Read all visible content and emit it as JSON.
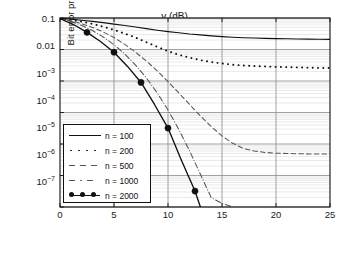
{
  "chart_data": {
    "type": "line",
    "title": "",
    "xlabel": "γ (dB)",
    "ylabel": "Bit error probability",
    "xlim": [
      0,
      25
    ],
    "ylim": [
      1e-07,
      0.1
    ],
    "yscale": "log",
    "grid": true,
    "legend_position": "lower-left",
    "xticks": [
      "0",
      "5",
      "10",
      "15",
      "20",
      "25"
    ],
    "xtick_values": [
      0,
      5,
      10,
      15,
      20,
      25
    ],
    "yticks": [
      "0.1",
      "0.01",
      "10−3",
      "10−4",
      "10−5",
      "10−6",
      "10−7"
    ],
    "ytick_values": [
      0.1,
      0.01,
      0.001,
      0.0001,
      1e-05,
      1e-06,
      1e-07
    ],
    "series": [
      {
        "name": "n = 100",
        "style": "solid",
        "color": "#111111",
        "x": [
          0,
          1,
          2,
          3,
          4,
          5,
          6,
          7,
          8,
          9,
          10,
          11,
          12,
          13,
          14,
          15,
          16,
          17,
          18,
          19,
          20,
          21,
          22,
          23,
          24,
          25
        ],
        "y": [
          0.098,
          0.092,
          0.085,
          0.078,
          0.071,
          0.064,
          0.058,
          0.052,
          0.046,
          0.041,
          0.037,
          0.034,
          0.031,
          0.029,
          0.027,
          0.0255,
          0.0245,
          0.0237,
          0.0231,
          0.0226,
          0.0222,
          0.0219,
          0.0216,
          0.0213,
          0.0211,
          0.0209
        ]
      },
      {
        "name": "n = 200",
        "style": "dotted",
        "color": "#111111",
        "x": [
          0,
          1,
          2,
          3,
          4,
          5,
          6,
          7,
          8,
          9,
          10,
          11,
          12,
          13,
          14,
          15,
          16,
          17,
          18,
          19,
          20,
          21,
          22,
          23,
          24,
          25
        ],
        "y": [
          0.098,
          0.088,
          0.077,
          0.065,
          0.053,
          0.042,
          0.032,
          0.024,
          0.017,
          0.0122,
          0.0088,
          0.0068,
          0.0055,
          0.0046,
          0.004,
          0.0036,
          0.0033,
          0.0031,
          0.003,
          0.0029,
          0.0028,
          0.00275,
          0.0027,
          0.00265,
          0.0026,
          0.0026
        ]
      },
      {
        "name": "n = 500",
        "style": "dashed",
        "color": "#555555",
        "x": [
          0,
          1,
          2,
          3,
          4,
          5,
          6,
          7,
          8,
          9,
          10,
          11,
          12,
          13,
          14,
          15,
          16,
          17,
          18,
          19,
          20,
          21,
          22,
          23,
          24,
          25
        ],
        "y": [
          0.097,
          0.082,
          0.066,
          0.05,
          0.036,
          0.024,
          0.0145,
          0.0082,
          0.0043,
          0.0021,
          0.00095,
          0.00042,
          0.00018,
          7.8e-05,
          3.6e-05,
          1.8e-05,
          1.05e-05,
          7.2e-06,
          6e-06,
          5.4e-06,
          5.1e-06,
          5e-06,
          4.9e-06,
          4.85e-06,
          4.8e-06,
          4.8e-06
        ]
      },
      {
        "name": "n = 1000",
        "style": "dashdot",
        "color": "#555555",
        "x": [
          0,
          1,
          2,
          3,
          4,
          5,
          6,
          7,
          8,
          9,
          10,
          11,
          12,
          13,
          14,
          15,
          16
        ],
        "y": [
          0.097,
          0.078,
          0.058,
          0.04,
          0.025,
          0.0142,
          0.0072,
          0.0032,
          0.00125,
          0.00042,
          0.00012,
          2.9e-05,
          6e-06,
          1.1e-06,
          2e-07,
          1.3e-07,
          1e-07
        ]
      },
      {
        "name": "n = 2000",
        "style": "solid-marker",
        "color": "#111111",
        "marker": "filled-circle",
        "x": [
          0,
          1.25,
          2.5,
          3.75,
          5,
          6.25,
          7.5,
          8.75,
          10,
          11.25,
          12.5,
          13
        ],
        "y": [
          0.096,
          0.062,
          0.035,
          0.018,
          0.0082,
          0.0029,
          0.0009,
          0.00018,
          3.2e-05,
          3e-06,
          3.2e-07,
          1e-07
        ],
        "marker_x": [
          2.5,
          5,
          7.5,
          10,
          12.5
        ],
        "marker_y": [
          0.035,
          0.0082,
          0.0009,
          3.2e-05,
          3.2e-07
        ]
      }
    ]
  },
  "legend": {
    "items": [
      {
        "label": "n = 100"
      },
      {
        "label": "n = 200"
      },
      {
        "label": "n = 500"
      },
      {
        "label": "n = 1000"
      },
      {
        "label": "n = 2000"
      }
    ]
  },
  "axes": {
    "xlabel": "γ (dB)",
    "ylabel": "Bit error probability",
    "xticks": [
      "0",
      "5",
      "10",
      "15",
      "20",
      "25"
    ],
    "ytick_0": "0.1",
    "ytick_1": "0.01",
    "ytick_2_base": "10",
    "ytick_2_exp": "−3",
    "ytick_3_exp": "−4",
    "ytick_4_exp": "−5",
    "ytick_5_exp": "−6",
    "ytick_6_exp": "−7"
  },
  "colors": {
    "axis": "#111111",
    "grid_major": "#8a8a8a",
    "grid_minor": "#d8d8d8",
    "series_dark": "#111111",
    "series_gray": "#555555",
    "background": "#ffffff"
  }
}
